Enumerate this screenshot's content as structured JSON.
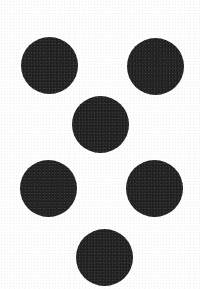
{
  "image": {
    "width": 202,
    "height": 289,
    "background_color": "#fefefe",
    "description": "Scanned pattern of six solid black filled circles arranged in a symmetric six-dot figure on a plain white background"
  },
  "palette": {
    "dot_color": "#242424",
    "background_color": "#fefefe"
  },
  "shapes": {
    "count": 6,
    "kind": "filled-circle",
    "dots": [
      {
        "id": "dot-top-left",
        "label": "Top left dot",
        "cx": 49.5,
        "cy": 65.0,
        "r": 28.5,
        "color": "#242424"
      },
      {
        "id": "dot-top-right",
        "label": "Top right dot",
        "cx": 155.5,
        "cy": 66.5,
        "r": 28.5,
        "color": "#242424"
      },
      {
        "id": "dot-center",
        "label": "Center dot",
        "cx": 100.5,
        "cy": 124.5,
        "r": 28.5,
        "color": "#242424"
      },
      {
        "id": "dot-middle-left",
        "label": "Middle left dot",
        "cx": 48.5,
        "cy": 188.0,
        "r": 28.5,
        "color": "#242424"
      },
      {
        "id": "dot-middle-right",
        "label": "Middle right dot",
        "cx": 154.5,
        "cy": 188.5,
        "r": 28.5,
        "color": "#242424"
      },
      {
        "id": "dot-bottom-center",
        "label": "Bottom center dot",
        "cx": 104.0,
        "cy": 257.0,
        "r": 28.5,
        "color": "#242424"
      }
    ]
  }
}
